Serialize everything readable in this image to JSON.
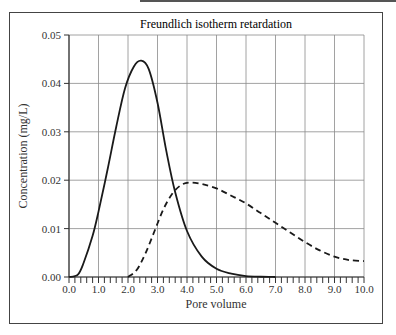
{
  "chart_data": {
    "type": "line",
    "title": "Freundlich isotherm retardation",
    "xlabel": "Pore volume",
    "ylabel": "Concentration (mg/L)",
    "xlim": [
      0.0,
      10.0
    ],
    "ylim": [
      0.0,
      0.05
    ],
    "x_ticks": [
      "0.0",
      "1.0",
      "2.0",
      "3.0",
      "4.0",
      "5.0",
      "6.0",
      "7.0",
      "8.0",
      "9.0",
      "10.0"
    ],
    "y_ticks": [
      "0.00",
      "0.01",
      "0.02",
      "0.03",
      "0.04",
      "0.05"
    ],
    "grid": true,
    "legend": null,
    "series": [
      {
        "name": "solid",
        "style": "solid",
        "x": [
          0.0,
          0.3,
          0.5,
          0.8,
          1.0,
          1.3,
          1.6,
          1.9,
          2.2,
          2.45,
          2.7,
          3.0,
          3.3,
          3.6,
          4.0,
          4.5,
          5.0,
          5.5,
          6.0,
          6.5,
          7.0
        ],
        "y": [
          0.0,
          0.0005,
          0.003,
          0.0085,
          0.0135,
          0.022,
          0.031,
          0.039,
          0.0435,
          0.0447,
          0.043,
          0.036,
          0.026,
          0.0175,
          0.0095,
          0.0042,
          0.0017,
          0.0007,
          0.0002,
          5e-05,
          0.0
        ]
      },
      {
        "name": "dashed",
        "style": "dashed",
        "x": [
          2.0,
          2.3,
          2.6,
          2.9,
          3.2,
          3.5,
          3.8,
          4.1,
          4.5,
          5.0,
          5.5,
          6.0,
          6.5,
          7.0,
          7.5,
          8.0,
          8.5,
          9.0,
          9.5,
          10.0
        ],
        "y": [
          0.0,
          0.0015,
          0.005,
          0.0095,
          0.014,
          0.0172,
          0.019,
          0.0195,
          0.0192,
          0.0183,
          0.0168,
          0.0152,
          0.0132,
          0.0112,
          0.0092,
          0.0072,
          0.0055,
          0.0042,
          0.0035,
          0.0033
        ]
      }
    ]
  }
}
